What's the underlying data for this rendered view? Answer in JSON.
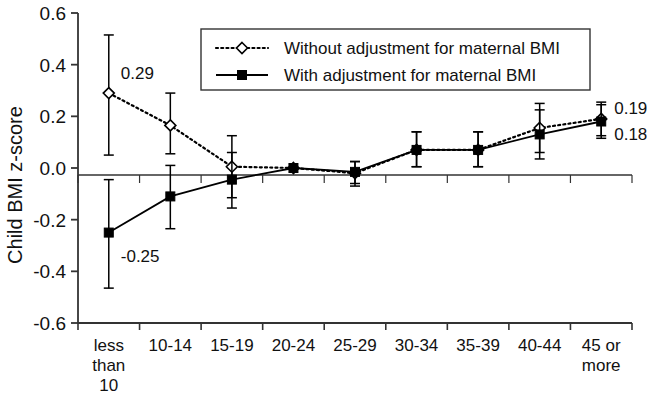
{
  "chart_data": {
    "type": "line",
    "title": "",
    "subtitle": "",
    "xlabel": "",
    "ylabel": "Child BMI z-score",
    "ylim": [
      -0.6,
      0.6
    ],
    "yticks": [
      0.6,
      0.4,
      0.2,
      0.0,
      -0.2,
      -0.4,
      -0.6
    ],
    "ytick_labels": [
      "0.6",
      "0.4",
      "0.2",
      "0.0",
      "-0.2",
      "-0.4",
      "-0.6"
    ],
    "grid": false,
    "zero_line": true,
    "legend_position": "top-center",
    "categories": [
      "less than 10",
      "10-14",
      "15-19",
      "20-24",
      "25-29",
      "30-34",
      "35-39",
      "40-44",
      "45 or more"
    ],
    "category_label_lines": [
      [
        "less",
        "than",
        "10"
      ],
      [
        "10-14"
      ],
      [
        "15-19"
      ],
      [
        "20-24"
      ],
      [
        "25-29"
      ],
      [
        "30-34"
      ],
      [
        "35-39"
      ],
      [
        "40-44"
      ],
      [
        "45 or",
        "more"
      ]
    ],
    "series": [
      {
        "name": "Without adjustment for maternal BMI",
        "marker": "open-diamond",
        "line_style": "dotted",
        "color": "#000000",
        "values": [
          0.29,
          0.165,
          0.005,
          0.0,
          -0.02,
          0.07,
          0.07,
          0.155,
          0.19
        ],
        "err_low": [
          0.05,
          0.055,
          -0.115,
          0.0,
          -0.07,
          0.005,
          0.005,
          0.06,
          0.125
        ],
        "err_high": [
          0.515,
          0.29,
          0.125,
          0.0,
          0.025,
          0.14,
          0.14,
          0.25,
          0.255
        ]
      },
      {
        "name": "With adjustment for maternal BMI",
        "marker": "filled-square",
        "line_style": "solid",
        "color": "#000000",
        "values": [
          -0.25,
          -0.11,
          -0.045,
          0.0,
          -0.015,
          0.07,
          0.07,
          0.13,
          0.18
        ],
        "err_low": [
          -0.465,
          -0.235,
          -0.155,
          0.0,
          -0.06,
          0.005,
          0.005,
          0.035,
          0.115
        ],
        "err_high": [
          -0.045,
          0.01,
          0.06,
          0.0,
          0.025,
          0.14,
          0.14,
          0.225,
          0.245
        ]
      }
    ],
    "annotations": [
      {
        "text": "0.29",
        "category": "less than 10",
        "series": "Without adjustment for maternal BMI",
        "value": 0.29,
        "placement": "right-above"
      },
      {
        "text": "-0.25",
        "category": "less than 10",
        "series": "With adjustment for maternal BMI",
        "value": -0.25,
        "placement": "right-below"
      },
      {
        "text": "0.19",
        "category": "45 or more",
        "series": "Without adjustment for maternal BMI",
        "value": 0.19,
        "placement": "right-above"
      },
      {
        "text": "0.18",
        "category": "45 or more",
        "series": "With adjustment for maternal BMI",
        "value": 0.18,
        "placement": "right-below"
      }
    ],
    "legend": [
      {
        "label": "Without adjustment for maternal BMI",
        "marker": "open-diamond",
        "line_style": "dotted"
      },
      {
        "label": "With adjustment for maternal BMI",
        "marker": "filled-square",
        "line_style": "solid"
      }
    ]
  }
}
